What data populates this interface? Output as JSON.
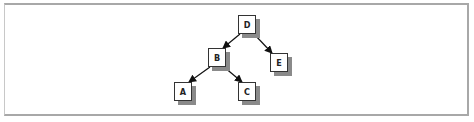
{
  "diagram": {
    "type": "binary-tree",
    "nodes": [
      {
        "id": "D",
        "label": "D",
        "x": 238,
        "y": 15
      },
      {
        "id": "B",
        "label": "B",
        "x": 208,
        "y": 48
      },
      {
        "id": "E",
        "label": "E",
        "x": 270,
        "y": 53
      },
      {
        "id": "A",
        "label": "A",
        "x": 174,
        "y": 82
      },
      {
        "id": "C",
        "label": "C",
        "x": 238,
        "y": 82
      }
    ],
    "edges": [
      {
        "from": "D",
        "to": "B"
      },
      {
        "from": "D",
        "to": "E"
      },
      {
        "from": "B",
        "to": "A"
      },
      {
        "from": "B",
        "to": "C"
      }
    ],
    "colors": {
      "edge": "#111111",
      "shadow": "#8a8a8a",
      "frame": "#a8a8a8"
    }
  }
}
